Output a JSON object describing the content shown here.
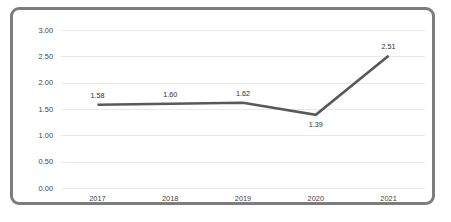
{
  "chart_data": {
    "type": "line",
    "title": "",
    "subtitle": "",
    "xlabel": "",
    "ylabel": "",
    "categories": [
      "2017",
      "2018",
      "2019",
      "2020",
      "2021"
    ],
    "values": [
      1.58,
      1.6,
      1.62,
      1.39,
      2.51
    ],
    "point_labels": [
      "1.58",
      "1.60",
      "1.62",
      "1.39",
      "2.51"
    ],
    "point_label_positions": [
      "above",
      "above",
      "above",
      "below",
      "above"
    ],
    "ylim": [
      0.0,
      3.0
    ],
    "y_ticks": [
      3.0,
      2.5,
      2.0,
      1.5,
      1.0,
      0.5,
      0.0
    ],
    "y_tick_labels": [
      "3.00",
      "2.50",
      "2.00",
      "1.50",
      "1.00",
      "0.50",
      "0.00"
    ],
    "grid": true,
    "grid_axis": "y",
    "legend": false,
    "legend_position": "none",
    "series": [
      {
        "name": "",
        "values": [
          1.58,
          1.6,
          1.62,
          1.39,
          2.51
        ]
      }
    ]
  },
  "style": {
    "line_color": "#595959",
    "grid_color": "#e9e9e9",
    "border_color": "#7d7d7d",
    "background_color": "#ffffff",
    "label_color": "#3f3f3f"
  }
}
